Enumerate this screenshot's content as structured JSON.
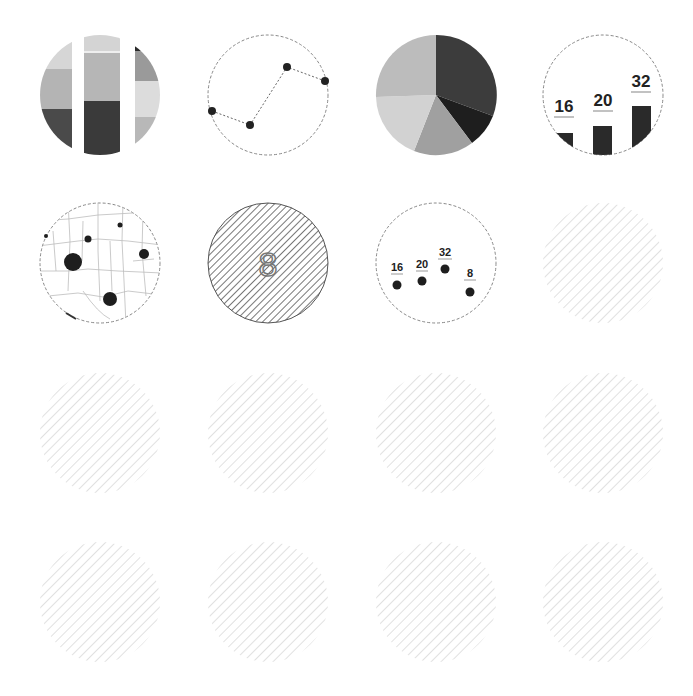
{
  "grid": {
    "columns": 4,
    "rows": 4,
    "col_centers": [
      100,
      268,
      436,
      603
    ],
    "row_centers": [
      95,
      263,
      433,
      602
    ],
    "diameter": 120
  },
  "colors": {
    "dark": "#333333",
    "mid_dark": "#7a7a7a",
    "mid": "#a8a8a8",
    "light": "#c4c4c4",
    "lighter": "#d6d6d6",
    "lightest": "#e2e2e2",
    "dashed_outline": "#888888",
    "hatch_dark": "#555555",
    "hatch_light": "#d0d0d0",
    "map_lines": "#bbbbbb"
  },
  "tiles": [
    {
      "id": "stacked-bar",
      "kind": "stacked-bar-icon"
    },
    {
      "id": "line-chart",
      "kind": "line-chart-icon",
      "points": [
        [
          10,
          78
        ],
        [
          44,
          92
        ],
        [
          80,
          34
        ],
        [
          113,
          48
        ]
      ]
    },
    {
      "id": "pie-chart",
      "kind": "pie-chart-icon"
    },
    {
      "id": "bar-chart",
      "kind": "bar-chart-icon",
      "labels": [
        "16",
        "20",
        "32"
      ]
    },
    {
      "id": "bubble-map",
      "kind": "bubble-map-icon"
    },
    {
      "id": "number-tile",
      "kind": "big-number-icon",
      "value": "8"
    },
    {
      "id": "dot-plot",
      "kind": "dot-plot-icon",
      "labels": [
        "16",
        "20",
        "32",
        "8"
      ]
    },
    {
      "id": "placeholder-1",
      "kind": "placeholder"
    },
    {
      "id": "placeholder-2",
      "kind": "placeholder"
    },
    {
      "id": "placeholder-3",
      "kind": "placeholder"
    },
    {
      "id": "placeholder-4",
      "kind": "placeholder"
    },
    {
      "id": "placeholder-5",
      "kind": "placeholder"
    },
    {
      "id": "placeholder-6",
      "kind": "placeholder"
    },
    {
      "id": "placeholder-7",
      "kind": "placeholder"
    },
    {
      "id": "placeholder-8",
      "kind": "placeholder"
    },
    {
      "id": "placeholder-9",
      "kind": "placeholder"
    }
  ],
  "bar_chart": {
    "labels": [
      "16",
      "20",
      "32"
    ]
  },
  "dot_plot": {
    "labels": [
      "16",
      "20",
      "32",
      "8"
    ]
  },
  "number_tile": {
    "value": "8"
  }
}
